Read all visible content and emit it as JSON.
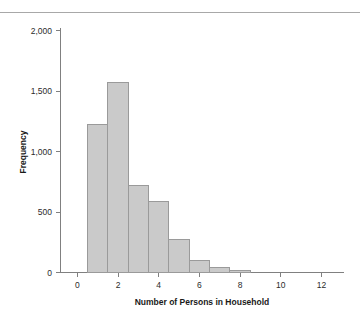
{
  "chart_data": {
    "type": "bar",
    "title": "",
    "subtitle": "",
    "xlabel": "Number of Persons in Household",
    "ylabel": "Frequency",
    "categories": [
      "1",
      "2",
      "3",
      "4",
      "5",
      "6",
      "7",
      "8"
    ],
    "bin_edges": [
      0.5,
      1.5,
      2.5,
      3.5,
      4.5,
      5.5,
      6.5,
      7.5,
      8.5
    ],
    "values": [
      1225,
      1570,
      720,
      590,
      270,
      100,
      45,
      15
    ],
    "xlim": [
      -0.8,
      12.9
    ],
    "ylim": [
      0,
      2100
    ],
    "xticks": [
      0,
      2,
      4,
      6,
      8,
      10,
      12
    ],
    "xtick_labels": [
      "0",
      "2",
      "4",
      "6",
      "8",
      "10",
      "12"
    ],
    "yticks": [
      0,
      500,
      1000,
      1500,
      2000
    ],
    "ytick_labels": [
      "0",
      "500",
      "1,000",
      "1,500",
      "2,000"
    ],
    "grid": false,
    "legend": null,
    "bar_fill_color": "#cacaca",
    "bar_edge_color": "#9a9a9a",
    "axis_color": "#808080"
  }
}
